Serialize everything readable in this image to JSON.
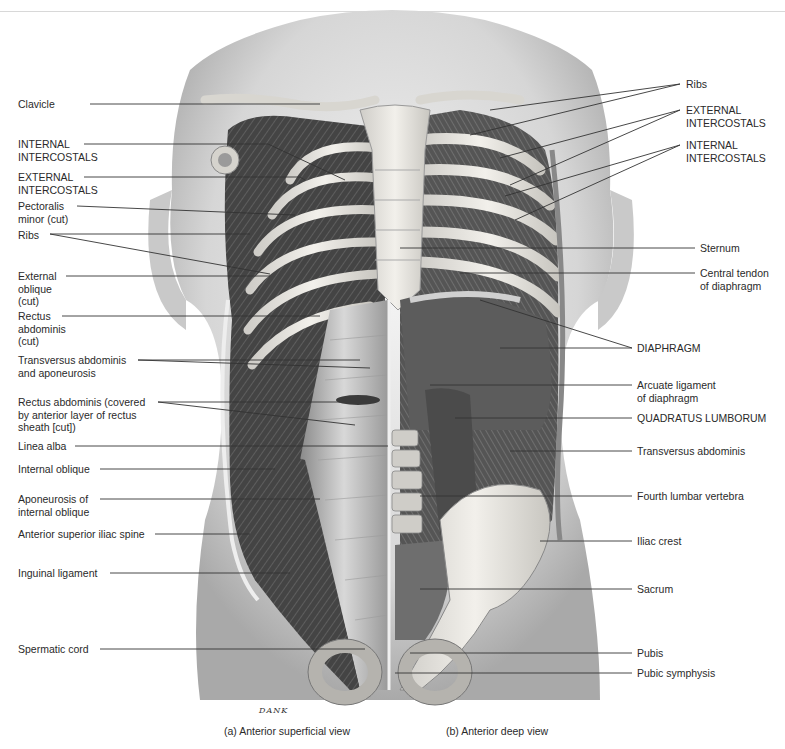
{
  "figure": {
    "captions": {
      "a": "(a) Anterior superficial view",
      "b": "(b) Anterior deep view"
    },
    "artist_signature": "DANK",
    "left_labels": [
      {
        "id": "clavicle",
        "text": "Clavicle"
      },
      {
        "id": "internal-intercostals-left",
        "text": "INTERNAL\nINTERCOSTALS"
      },
      {
        "id": "external-intercostals-left",
        "text": "EXTERNAL\nINTERCOSTALS"
      },
      {
        "id": "pectoralis-minor",
        "text": "Pectoralis\nminor (cut)"
      },
      {
        "id": "ribs-left",
        "text": "Ribs"
      },
      {
        "id": "external-oblique",
        "text": "External\noblique\n(cut)"
      },
      {
        "id": "rectus-abdominis-cut",
        "text": "Rectus\nabdominis\n(cut)"
      },
      {
        "id": "transversus-aponeurosis",
        "text": "Transversus abdominis\nand aponeurosis"
      },
      {
        "id": "rectus-abdominis-covered",
        "text": "Rectus abdominis (covered\nby anterior layer of rectus\nsheath [cut])"
      },
      {
        "id": "linea-alba",
        "text": "Linea alba"
      },
      {
        "id": "internal-oblique",
        "text": "Internal oblique"
      },
      {
        "id": "aponeurosis-internal-oblique",
        "text": "Aponeurosis of\ninternal oblique"
      },
      {
        "id": "asis",
        "text": "Anterior superior iliac spine"
      },
      {
        "id": "inguinal-ligament",
        "text": "Inguinal ligament"
      },
      {
        "id": "spermatic-cord",
        "text": "Spermatic cord"
      }
    ],
    "right_labels": [
      {
        "id": "ribs-right",
        "text": "Ribs"
      },
      {
        "id": "external-intercostals-right",
        "text": "EXTERNAL\nINTERCOSTALS"
      },
      {
        "id": "internal-intercostals-right",
        "text": "INTERNAL\nINTERCOSTALS"
      },
      {
        "id": "sternum",
        "text": "Sternum"
      },
      {
        "id": "central-tendon",
        "text": "Central tendon\nof diaphragm"
      },
      {
        "id": "diaphragm",
        "text": "DIAPHRAGM"
      },
      {
        "id": "arcuate-ligament",
        "text": "Arcuate ligament\nof diaphragm"
      },
      {
        "id": "quadratus-lumborum",
        "text": "QUADRATUS LUMBORUM"
      },
      {
        "id": "transversus-abdominis",
        "text": "Transversus abdominis"
      },
      {
        "id": "fourth-lumbar",
        "text": "Fourth lumbar vertebra"
      },
      {
        "id": "iliac-crest",
        "text": "Iliac crest"
      },
      {
        "id": "sacrum",
        "text": "Sacrum"
      },
      {
        "id": "pubis",
        "text": "Pubis"
      },
      {
        "id": "pubic-symphysis",
        "text": "Pubic symphysis"
      }
    ],
    "colors": {
      "body_silhouette": "#d9d9d9",
      "muscle_dark": "#4a4a4a",
      "bone": "#e6e4df",
      "leader_line": "#333333"
    }
  }
}
